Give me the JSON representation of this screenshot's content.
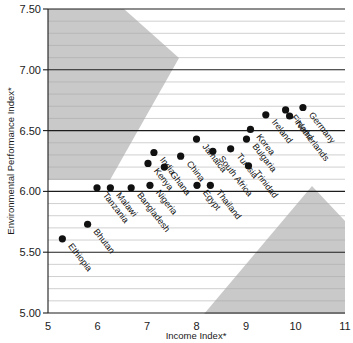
{
  "chart_data": {
    "type": "scatter",
    "title": "",
    "xlabel": "Income Index*",
    "ylabel": "Environmental Performance Index*",
    "xlim": [
      5,
      11
    ],
    "ylim": [
      5.0,
      7.5
    ],
    "x_ticks": [
      "5",
      "6",
      "7",
      "8",
      "9",
      "10",
      "11"
    ],
    "x_tick_values": [
      5,
      6,
      7,
      8,
      9,
      10,
      11
    ],
    "y_ticks": [
      "7.50",
      "7.00",
      "6.50",
      "6.00",
      "5.50",
      "5.00"
    ],
    "y_tick_values": [
      7.5,
      7.0,
      6.5,
      6.0,
      5.5,
      5.0
    ],
    "grid": "horizontal-minor-and-major",
    "minor_gridline_step": 0.1,
    "legend": "none",
    "points": [
      {
        "label": "Ethiopia",
        "x": 5.29,
        "y": 5.61
      },
      {
        "label": "Bhutan",
        "x": 5.8,
        "y": 5.73
      },
      {
        "label": "Tanzania",
        "x": 5.99,
        "y": 6.03
      },
      {
        "label": "Malawi",
        "x": 6.26,
        "y": 6.03
      },
      {
        "label": "Bangladesh",
        "x": 6.68,
        "y": 6.03
      },
      {
        "label": "Kenya",
        "x": 7.02,
        "y": 6.23
      },
      {
        "label": "Nigeria",
        "x": 7.06,
        "y": 6.05
      },
      {
        "label": "India",
        "x": 7.14,
        "y": 6.32
      },
      {
        "label": "Ghana",
        "x": 7.35,
        "y": 6.2
      },
      {
        "label": "China",
        "x": 7.68,
        "y": 6.29
      },
      {
        "label": "Egypt",
        "x": 8.01,
        "y": 6.05
      },
      {
        "label": "Jamaica",
        "x": 8.0,
        "y": 6.43
      },
      {
        "label": "South Africa",
        "x": 8.33,
        "y": 6.33
      },
      {
        "label": "Thailand",
        "x": 8.28,
        "y": 6.05
      },
      {
        "label": "Tunisia",
        "x": 8.69,
        "y": 6.35
      },
      {
        "label": "Korea",
        "x": 9.09,
        "y": 6.51
      },
      {
        "label": "Bulgaria",
        "x": 9.01,
        "y": 6.43
      },
      {
        "label": "Trinidad",
        "x": 9.05,
        "y": 6.21
      },
      {
        "label": "Ireland",
        "x": 9.4,
        "y": 6.63
      },
      {
        "label": "Finland",
        "x": 9.8,
        "y": 6.67
      },
      {
        "label": "Netherlands",
        "x": 9.88,
        "y": 6.62
      },
      {
        "label": "Germany",
        "x": 10.15,
        "y": 6.69
      }
    ],
    "shaded_regions": [
      {
        "name": "upper-left-band",
        "color": "#c9c9c9"
      },
      {
        "name": "lower-right-band",
        "color": "#c9c9c9"
      }
    ]
  },
  "axes": {
    "x_title": "Income Index*",
    "y_title": "Environmental Performance Index*"
  }
}
